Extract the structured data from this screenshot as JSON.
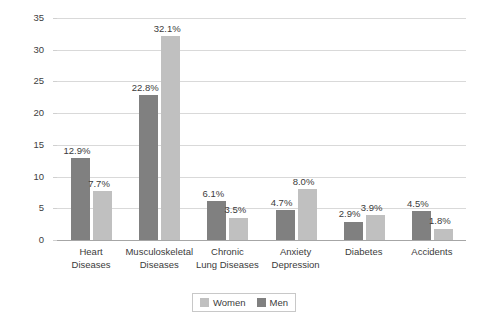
{
  "chart_data": {
    "type": "bar",
    "title": "",
    "xlabel": "",
    "ylabel": "Percent Contribution to Later-Life Disability",
    "ylim": [
      0,
      35
    ],
    "yticks": [
      0,
      5,
      10,
      15,
      20,
      25,
      30,
      35
    ],
    "grid": true,
    "legend_position": "bottom",
    "categories": [
      "Heart Diseases",
      "Musculoskeletal Diseases",
      "Chronic Lung Diseases",
      "Anxiety Depression",
      "Diabetes",
      "Accidents"
    ],
    "category_lines": [
      [
        "Heart",
        "Diseases"
      ],
      [
        "Musculoskeletal",
        "Diseases"
      ],
      [
        "Chronic",
        "Lung Diseases"
      ],
      [
        "Anxiety",
        "Depression"
      ],
      [
        "Diabetes",
        ""
      ],
      [
        "Accidents",
        ""
      ]
    ],
    "series": [
      {
        "name": "Men",
        "color": "#808080",
        "values": [
          12.9,
          22.8,
          6.1,
          4.7,
          2.9,
          4.5
        ],
        "labels": [
          "12.9%",
          "22.8%",
          "6.1%",
          "4.7%",
          "2.9%",
          "4.5%"
        ]
      },
      {
        "name": "Women",
        "color": "#c0c0c0",
        "values": [
          7.7,
          32.1,
          3.5,
          8.0,
          3.9,
          1.8
        ],
        "labels": [
          "7.7%",
          "32.1%",
          "3.5%",
          "8.0%",
          "3.9%",
          "1.8%"
        ]
      }
    ]
  },
  "axis": {
    "y_title": "Percent Contribution to Later-Life Disability",
    "tick_labels": [
      "35",
      "30",
      "25",
      "20",
      "15",
      "10",
      "5",
      "0"
    ]
  },
  "legend": {
    "items": [
      {
        "label": "Women",
        "color": "#c0c0c0"
      },
      {
        "label": "Men",
        "color": "#808080"
      }
    ]
  }
}
